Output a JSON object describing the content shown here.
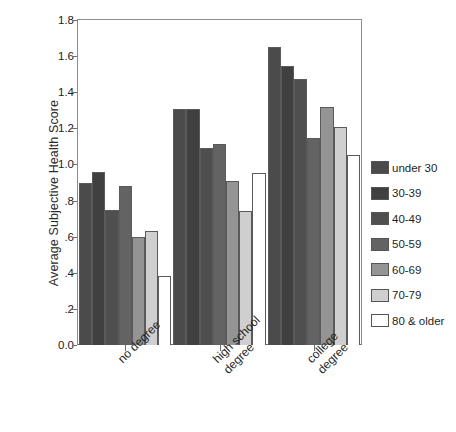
{
  "chart_data": {
    "type": "bar",
    "title": "",
    "xlabel": "",
    "ylabel": "Average Subjective Health Score",
    "ylim": [
      0.0,
      1.8
    ],
    "yticks": [
      "0.0",
      ".2",
      ".4",
      ".6",
      ".8",
      "1.0",
      "1.2",
      "1.4",
      "1.6",
      "1.8"
    ],
    "ytick_values": [
      0.0,
      0.2,
      0.4,
      0.6,
      0.8,
      1.0,
      1.2,
      1.4,
      1.6,
      1.8
    ],
    "grid": false,
    "legend_position": "right",
    "categories": [
      "no degree",
      "high school degree",
      "college degree"
    ],
    "category_lines": [
      [
        "no degree"
      ],
      [
        "high school",
        "degree"
      ],
      [
        "college",
        "degree"
      ]
    ],
    "series": [
      {
        "name": "under 30",
        "color": "#4b4b4b",
        "values": [
          0.9,
          1.305,
          1.65
        ]
      },
      {
        "name": "30-39",
        "color": "#404040",
        "values": [
          0.96,
          1.305,
          1.545
        ]
      },
      {
        "name": "40-49",
        "color": "#4f4f4f",
        "values": [
          0.75,
          1.09,
          1.475
        ]
      },
      {
        "name": "50-59",
        "color": "#636363",
        "values": [
          0.88,
          1.115,
          1.145
        ]
      },
      {
        "name": "60-69",
        "color": "#949494",
        "values": [
          0.6,
          0.91,
          1.32
        ]
      },
      {
        "name": "70-79",
        "color": "#cfcfcf",
        "values": [
          0.63,
          0.74,
          1.21
        ]
      },
      {
        "name": "80 & older",
        "color": "#ffffff",
        "values": [
          0.38,
          0.95,
          1.055
        ]
      }
    ]
  }
}
